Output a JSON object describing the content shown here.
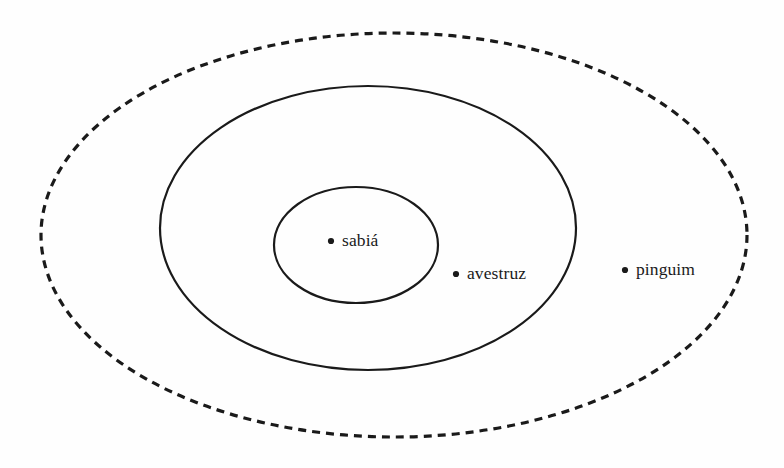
{
  "diagram": {
    "type": "euler-venn-set-diagram",
    "background_color": "#fefefe",
    "stroke_color": "#1a1a1a",
    "regions": [
      {
        "name": "outer-dashed-ellipse",
        "style": "dashed",
        "cx": 394,
        "cy": 235,
        "rx": 353,
        "ry": 202,
        "stroke_width": 3.2,
        "dash_pattern": "8 6"
      },
      {
        "name": "middle-solid-ellipse",
        "style": "solid",
        "cx": 368,
        "cy": 228,
        "rx": 208,
        "ry": 142,
        "stroke_width": 2.2,
        "dash_pattern": "none"
      },
      {
        "name": "inner-solid-ellipse",
        "style": "solid",
        "cx": 356,
        "cy": 245,
        "rx": 82,
        "ry": 58,
        "stroke_width": 2.2,
        "dash_pattern": "none"
      }
    ],
    "points": [
      {
        "label": "sabiá",
        "dot_x": 331,
        "dot_y": 241,
        "dot_radius": 3.1,
        "region": "inner-solid-ellipse"
      },
      {
        "label": "avestruz",
        "dot_x": 456,
        "dot_y": 274,
        "dot_radius": 3.1,
        "region": "middle-solid-ellipse"
      },
      {
        "label": "pinguim",
        "dot_x": 625,
        "dot_y": 270,
        "dot_radius": 3.1,
        "region": "outer-dashed-ellipse"
      }
    ]
  }
}
